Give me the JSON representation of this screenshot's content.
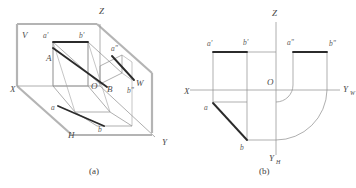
{
  "figure": {
    "title_a": "(a)",
    "title_b": "(b)",
    "background_color": "#ffffff",
    "bold_line_color": "#2b2b2b",
    "thin_line_color": "#8d8d8d",
    "plane_edge_color": "#b4b4b4",
    "label_color": "#4a4a4a"
  },
  "diagram_a": {
    "caption": "(a)",
    "axis_labels": [
      {
        "name": "x-axis-label",
        "text": "X",
        "x": 10,
        "y": 92
      },
      {
        "name": "y-axis-label",
        "text": "Y",
        "x": 162,
        "y": 145
      },
      {
        "name": "z-axis-label",
        "text": "Z",
        "x": 99,
        "y": 14
      }
    ],
    "plane_labels": [
      {
        "name": "v-plane-label",
        "text": "V",
        "x": 22,
        "y": 38
      },
      {
        "name": "h-plane-label",
        "text": "H",
        "x": 68,
        "y": 138
      },
      {
        "name": "w-plane-label",
        "text": "W",
        "x": 139,
        "y": 86
      }
    ],
    "point_labels": [
      {
        "name": "point-a-prime",
        "text": "a'",
        "x": 44,
        "y": 38
      },
      {
        "name": "point-b-prime",
        "text": "b'",
        "x": 80,
        "y": 38
      },
      {
        "name": "point-a-double-prime",
        "text": "a\"",
        "x": 113,
        "y": 51
      },
      {
        "name": "point-b-double-prime",
        "text": "b\"",
        "x": 129,
        "y": 92
      },
      {
        "name": "point-A",
        "text": "A",
        "x": 48,
        "y": 60
      },
      {
        "name": "point-B",
        "text": "B",
        "x": 109,
        "y": 91
      },
      {
        "name": "origin-O",
        "text": "O",
        "x": 94,
        "y": 89
      },
      {
        "name": "point-a-lower",
        "text": "a",
        "x": 52,
        "y": 109
      },
      {
        "name": "point-b-lower",
        "text": "b",
        "x": 99,
        "y": 130
      }
    ]
  },
  "diagram_b": {
    "caption": "(b)",
    "axis_labels": [
      {
        "name": "x-axis-label",
        "text": "X",
        "x": 184,
        "y": 94
      },
      {
        "name": "z-axis-label",
        "text": "Z",
        "x": 273,
        "y": 16
      },
      {
        "name": "yw-axis-label",
        "text": "Y",
        "x": 337,
        "y": 93
      },
      {
        "name": "yw-axis-subscript",
        "text": "W",
        "x": 344,
        "y": 96
      },
      {
        "name": "yh-axis-label",
        "text": "Y",
        "x": 272,
        "y": 158
      },
      {
        "name": "yh-axis-subscript",
        "text": "H",
        "x": 278,
        "y": 161
      }
    ],
    "point_labels": [
      {
        "name": "point-a-prime",
        "text": "a'",
        "x": 209,
        "y": 45
      },
      {
        "name": "point-b-prime",
        "text": "b'",
        "x": 246,
        "y": 44
      },
      {
        "name": "point-a-double-prime",
        "text": "a\"",
        "x": 286,
        "y": 44
      },
      {
        "name": "point-b-double-prime",
        "text": "b\"",
        "x": 330,
        "y": 45
      },
      {
        "name": "origin-O",
        "text": "O",
        "x": 271,
        "y": 83
      },
      {
        "name": "point-a-lower",
        "text": "a",
        "x": 205,
        "y": 109
      },
      {
        "name": "point-b-lower",
        "text": "b",
        "x": 241,
        "y": 147
      }
    ]
  }
}
